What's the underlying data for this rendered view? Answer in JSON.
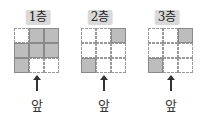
{
  "panels": [
    {
      "label": "1층",
      "cells": [
        0,
        1,
        1,
        1,
        1,
        1,
        1,
        0,
        0
      ]
    },
    {
      "label": "2층",
      "cells": [
        0,
        0,
        1,
        0,
        0,
        0,
        1,
        0,
        0
      ]
    },
    {
      "label": "3층",
      "cells": [
        0,
        0,
        1,
        0,
        0,
        0,
        1,
        0,
        0
      ]
    }
  ],
  "front_label": "앞",
  "colors": {
    "filled": "#bdbdbd",
    "label_bg": "#d9d9d9"
  }
}
